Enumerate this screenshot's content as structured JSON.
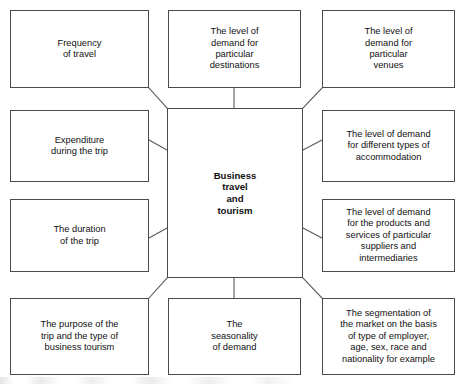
{
  "diagram": {
    "center": {
      "id": "center",
      "label": "Business\ntravel\nand\ntourism"
    },
    "nodes": [
      {
        "id": "frequency-of-travel",
        "label": "Frequency\nof travel"
      },
      {
        "id": "demand-destinations",
        "label": "The level of\ndemand for\nparticular\ndestinations"
      },
      {
        "id": "demand-venues",
        "label": "The level of\ndemand for\nparticular\nvenues"
      },
      {
        "id": "expenditure-during-trip",
        "label": "Expenditure\nduring the trip"
      },
      {
        "id": "demand-accommodation",
        "label": "The level of demand\nfor different types of\naccommodation"
      },
      {
        "id": "duration-of-trip",
        "label": "The duration\nof the trip"
      },
      {
        "id": "demand-suppliers",
        "label": "The level of demand\nfor the products and\nservices of particular\nsuppliers and\nintermediaries"
      },
      {
        "id": "purpose-of-trip",
        "label": "The purpose of the\ntrip and the type of\nbusiness tourism"
      },
      {
        "id": "seasonality-of-demand",
        "label": "The\nseasonality\nof demand"
      },
      {
        "id": "market-segmentation",
        "label": "The segmentation of\nthe market on the basis\nof type of employer,\nage, sex, race and\nnationality for example"
      }
    ],
    "colors": {
      "box_border": "#4a4a4a",
      "connector": "#5a5a5a",
      "text": "#111111",
      "background": "#ffffff"
    }
  }
}
